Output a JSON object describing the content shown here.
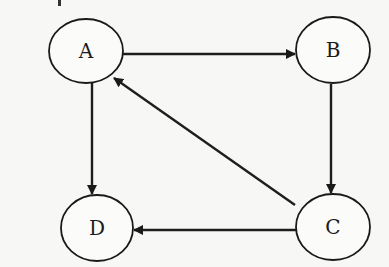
{
  "diagram": {
    "type": "directed-graph",
    "colors": {
      "background": "#f7f7f5",
      "stroke": "#1a1a1a",
      "node_fill": "#fbfbf9"
    },
    "nodes": [
      {
        "id": "A",
        "label": "A",
        "cx": 86,
        "cy": 51,
        "rx": 37,
        "ry": 32
      },
      {
        "id": "B",
        "label": "B",
        "cx": 333,
        "cy": 50,
        "rx": 37,
        "ry": 33
      },
      {
        "id": "C",
        "label": "C",
        "cx": 333,
        "cy": 227,
        "rx": 37,
        "ry": 33
      },
      {
        "id": "D",
        "label": "D",
        "cx": 97,
        "cy": 228,
        "rx": 36,
        "ry": 33
      }
    ],
    "edges": [
      {
        "from": "A",
        "to": "B",
        "label": "A to B"
      },
      {
        "from": "B",
        "to": "C",
        "label": "B to C"
      },
      {
        "from": "C",
        "to": "A",
        "label": "C to A"
      },
      {
        "from": "A",
        "to": "D",
        "label": "A to D"
      },
      {
        "from": "C",
        "to": "D",
        "label": "C to D"
      }
    ]
  }
}
